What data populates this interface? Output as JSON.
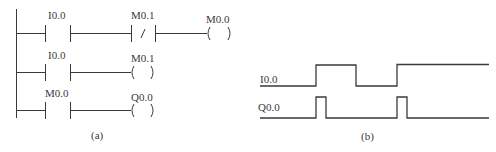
{
  "figure_a": {
    "caption": "(a)",
    "rungs": [
      {
        "elements": [
          {
            "type": "NO_contact",
            "label": "I0.0"
          },
          {
            "type": "NC_contact",
            "label": "M0.1",
            "symbol": "/"
          },
          {
            "type": "coil",
            "label": "M0.0"
          }
        ]
      },
      {
        "elements": [
          {
            "type": "NO_contact",
            "label": "I0.0"
          },
          {
            "type": "coil",
            "label": "M0.1"
          }
        ]
      },
      {
        "elements": [
          {
            "type": "NO_contact",
            "label": "M0.0"
          },
          {
            "type": "coil",
            "label": "Q0.0"
          }
        ]
      }
    ]
  },
  "figure_b": {
    "caption": "(b)",
    "signals": [
      {
        "name": "I0.0",
        "description": "Input: low, high, low, then high to end",
        "edges": [
          "rise",
          "fall",
          "rise"
        ]
      },
      {
        "name": "Q0.0",
        "description": "Output: one-scan pulse on each rising edge of I0.0",
        "pulses": 2
      }
    ]
  },
  "colors": {
    "line": "#3a3a3a",
    "background": "#ffffff"
  }
}
